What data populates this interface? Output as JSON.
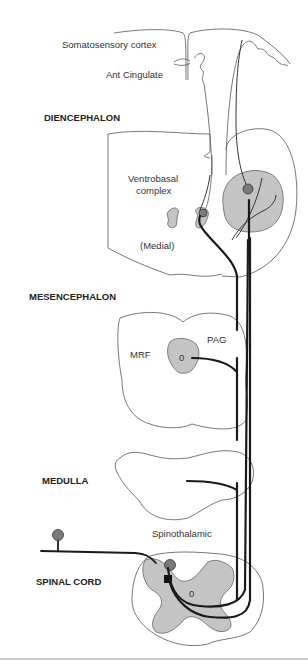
{
  "diagram": {
    "type": "neuroanatomy pathway diagram",
    "labels": {
      "somatosensory_cortex": "Somatosensory cortex",
      "ant_cingulate": "Ant Cingulate",
      "ventrobasal_1": "Ventrobasal",
      "ventrobasal_2": "complex",
      "medial": "(Medial)",
      "mrf": "MRF",
      "pag": "PAG",
      "spinothalamic": "Spinothalamic",
      "mesencephalon_nucleus": "0",
      "spinal_canal": "0"
    },
    "regions": {
      "diencephalon": "DIENCEPHALON",
      "mesencephalon": "MESENCEPHALON",
      "medulla": "MEDULLA",
      "spinal_cord": "SPINAL CORD"
    },
    "colors": {
      "gray_matter": "#c4c4c4",
      "cell_body": "#7a7a7a",
      "tract": "#1a1a1a",
      "outline": "#555555"
    }
  }
}
